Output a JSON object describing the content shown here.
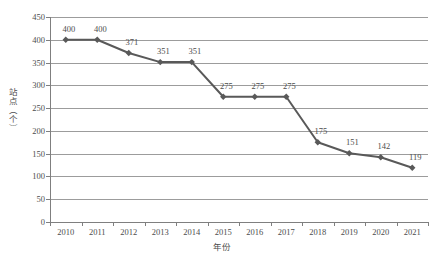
{
  "chart_data": {
    "type": "line",
    "title": "",
    "xlabel": "年份",
    "ylabel": "站点（个）",
    "categories": [
      "2010",
      "2011",
      "2012",
      "2013",
      "2014",
      "2015",
      "2016",
      "2017",
      "2018",
      "2019",
      "2020",
      "2021"
    ],
    "values": [
      400,
      400,
      371,
      351,
      351,
      275,
      275,
      275,
      175,
      151,
      142,
      119
    ],
    "data_labels": [
      "400",
      "400",
      "371",
      "351",
      "351",
      "275",
      "275",
      "275",
      "175",
      "151",
      "142",
      "119"
    ],
    "ylim": [
      0,
      450
    ],
    "ytick_step": 50,
    "yticks": [
      "0",
      "50",
      "100",
      "150",
      "200",
      "250",
      "300",
      "350",
      "400",
      "450"
    ],
    "grid": "horizontal",
    "legend": "none",
    "series": [
      {
        "name": "站点（个）",
        "values": [
          400,
          400,
          371,
          351,
          351,
          275,
          275,
          275,
          175,
          151,
          142,
          119
        ],
        "marker": "diamond",
        "line_color": "#595959",
        "marker_color": "#595959"
      }
    ]
  },
  "colors": {
    "line": "#595959",
    "marker": "#595959",
    "gridline": "#9c9c9c",
    "axis": "#7f7f7f",
    "text": "#4d4d4d",
    "background": "#ffffff"
  }
}
